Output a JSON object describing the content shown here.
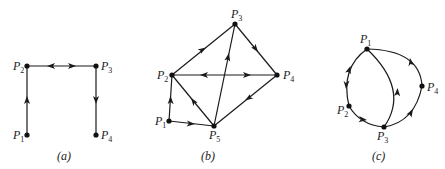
{
  "figure": {
    "panels": [
      {
        "id": "a",
        "caption": "(a)",
        "nodes": [
          {
            "id": "P1",
            "letter": "P",
            "sub": "1"
          },
          {
            "id": "P2",
            "letter": "P",
            "sub": "2"
          },
          {
            "id": "P3",
            "letter": "P",
            "sub": "3"
          },
          {
            "id": "P4",
            "letter": "P",
            "sub": "4"
          }
        ],
        "edges": [
          {
            "from": "P1",
            "to": "P2",
            "directed": true
          },
          {
            "from": "P2",
            "to": "P3",
            "directed": true,
            "bidirectional": true
          },
          {
            "from": "P3",
            "to": "P4",
            "directed": true
          }
        ]
      },
      {
        "id": "b",
        "caption": "(b)",
        "nodes": [
          {
            "id": "P1",
            "letter": "P",
            "sub": "1"
          },
          {
            "id": "P2",
            "letter": "P",
            "sub": "2"
          },
          {
            "id": "P3",
            "letter": "P",
            "sub": "3"
          },
          {
            "id": "P4",
            "letter": "P",
            "sub": "4"
          },
          {
            "id": "P5",
            "letter": "P",
            "sub": "5"
          }
        ],
        "edges": [
          {
            "from": "P1",
            "to": "P2",
            "directed": true
          },
          {
            "from": "P1",
            "to": "P5",
            "directed": true
          },
          {
            "from": "P2",
            "to": "P3",
            "directed": true
          },
          {
            "from": "P3",
            "to": "P4",
            "directed": true
          },
          {
            "from": "P2",
            "to": "P4",
            "directed": true,
            "bidirectional": true
          },
          {
            "from": "P4",
            "to": "P5",
            "directed": true
          },
          {
            "from": "P5",
            "to": "P2",
            "directed": true
          },
          {
            "from": "P5",
            "to": "P3",
            "directed": true
          }
        ]
      },
      {
        "id": "c",
        "caption": "(c)",
        "nodes": [
          {
            "id": "P1",
            "letter": "P",
            "sub": "1"
          },
          {
            "id": "P2",
            "letter": "P",
            "sub": "2"
          },
          {
            "id": "P3",
            "letter": "P",
            "sub": "3"
          },
          {
            "id": "P4",
            "letter": "P",
            "sub": "4"
          }
        ],
        "edges": [
          {
            "from": "P1",
            "to": "P2",
            "directed": true,
            "bidirectional": true,
            "curved": true
          },
          {
            "from": "P2",
            "to": "P3",
            "directed": true,
            "curved": true
          },
          {
            "from": "P3",
            "to": "P1",
            "directed": true,
            "curved": true
          },
          {
            "from": "P3",
            "to": "P4",
            "directed": true,
            "curved": true
          },
          {
            "from": "P4",
            "to": "P1",
            "directed": true,
            "curved": true
          }
        ]
      }
    ]
  }
}
